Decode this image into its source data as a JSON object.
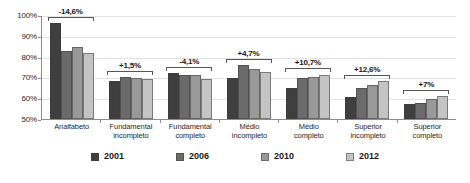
{
  "chart_data": {
    "type": "bar",
    "title": "",
    "subtitle": "",
    "xlabel": "",
    "ylabel": "",
    "ylim": [
      50,
      100
    ],
    "ytick_labels": [
      "100%",
      "90%",
      "80%",
      "70%",
      "60%",
      "50%"
    ],
    "ytick_values": [
      100,
      90,
      80,
      70,
      60,
      50
    ],
    "grid": true,
    "legend_position": "bottom",
    "categories": [
      "Analfabeto",
      "Fundamental incompleto",
      "Fundamental completo",
      "Médio incompleto",
      "Médio completo",
      "Superior incompleto",
      "Superior completo"
    ],
    "category_lines": [
      [
        "Analfabeto",
        ""
      ],
      [
        "Fundamental",
        "incompleto"
      ],
      [
        "Fundamental",
        "completo"
      ],
      [
        "Médio",
        "incompleto"
      ],
      [
        "Médio",
        "completo"
      ],
      [
        "Superior",
        "incompleto"
      ],
      [
        "Superior",
        "completo"
      ]
    ],
    "series": [
      {
        "name": "2001",
        "color": "#3f3f3f",
        "values": [
          96.0,
          68.5,
          72.0,
          69.8,
          64.8,
          60.8,
          57.0
        ]
      },
      {
        "name": "2006",
        "color": "#6b6b6b",
        "values": [
          82.5,
          70.3,
          71.2,
          76.0,
          69.7,
          65.0,
          57.8
        ]
      },
      {
        "name": "2010",
        "color": "#999999",
        "values": [
          84.5,
          69.8,
          71.2,
          74.2,
          70.4,
          66.2,
          59.5
        ]
      },
      {
        "name": "2012",
        "color": "#c4c4c4",
        "values": [
          81.8,
          69.2,
          69.2,
          72.7,
          71.4,
          68.3,
          61.0
        ]
      }
    ],
    "annotations": [
      {
        "category": "Analfabeto",
        "label": "-14,6%"
      },
      {
        "category": "Fundamental incompleto",
        "label": "+1,5%"
      },
      {
        "category": "Fundamental completo",
        "label": "-4,1%"
      },
      {
        "category": "Médio incompleto",
        "label": "+4,7%"
      },
      {
        "category": "Médio completo",
        "label": "+10,7%"
      },
      {
        "category": "Superior incompleto",
        "label": "+12,6%"
      },
      {
        "category": "Superior completo",
        "label": "+7%"
      }
    ]
  },
  "legend": {
    "items": [
      {
        "label": "2001",
        "color": "#3f3f3f"
      },
      {
        "label": "2006",
        "color": "#6b6b6b"
      },
      {
        "label": "2010",
        "color": "#999999"
      },
      {
        "label": "2012",
        "color": "#c4c4c4"
      }
    ]
  }
}
